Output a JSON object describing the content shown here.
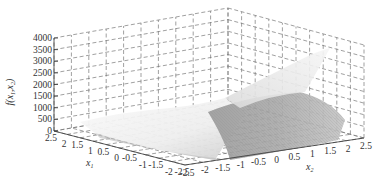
{
  "chart_data": {
    "type": "surface3d",
    "title": "",
    "zlabel": "f(x1,x2)",
    "xlabel": "x1",
    "ylabel": "x2",
    "zlim": [
      0,
      4000
    ],
    "xlim": [
      -2.5,
      2.5
    ],
    "ylim": [
      -2.5,
      2.5
    ],
    "z_ticks": [
      "0",
      "500",
      "1000",
      "1500",
      "2000",
      "2500",
      "3000",
      "3500",
      "4000"
    ],
    "x1_ticks": [
      "2.5",
      "2",
      "1.5",
      "1",
      "0.5",
      "0",
      "-0.5",
      "-1",
      "-1.5",
      "-2",
      "-2.5"
    ],
    "x2_ticks": [
      "-2.5",
      "-2",
      "-1.5",
      "-1",
      "-0.5",
      "0",
      "0.5",
      "1",
      "1.5",
      "2",
      "2.5"
    ],
    "grid": true,
    "colormap": "grayscale",
    "function_description": "Rosenbrock-like surface: f(x1,x2)=100(x2-x1^2)^2+(1-x1)^2, peaks near 3600+ at corner x1=-2.5,x2=2.5 region; low valley along parabola"
  },
  "labels": {
    "zlabel_main": "f(x",
    "zlabel_sub1": "1",
    "zlabel_mid": ",x",
    "zlabel_sub2": "2",
    "zlabel_end": ")",
    "x1_main": "x",
    "x1_sub": "1",
    "x2_main": "x",
    "x2_sub": "2"
  }
}
